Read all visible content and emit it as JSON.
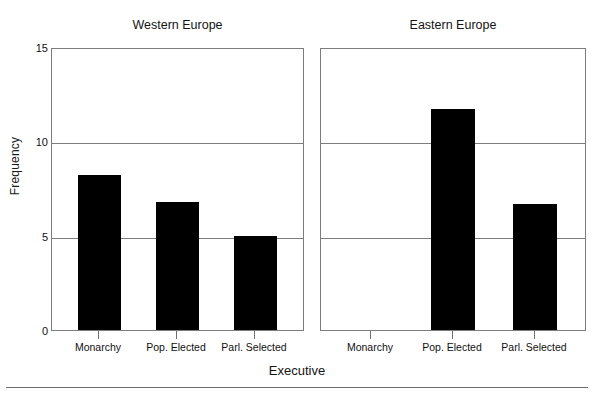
{
  "chart_data": {
    "type": "bar",
    "title": "",
    "xlabel": "Executive",
    "ylabel": "Frequency",
    "categories": [
      "Monarchy",
      "Pop. Elected",
      "Parl. Selected"
    ],
    "ylim": [
      0,
      15
    ],
    "yticks": [
      0,
      5,
      10,
      15
    ],
    "grid": "horizontal gridlines at y = 5 and y = 10",
    "legend": "none",
    "panels": [
      {
        "name": "Western Europe",
        "values": [
          8.2,
          6.8,
          5.0
        ]
      },
      {
        "name": "Eastern Europe",
        "values": [
          0,
          11.7,
          6.7
        ]
      }
    ]
  },
  "axes": {
    "y_title": "Frequency",
    "x_title": "Executive",
    "y_tick_labels": [
      "0",
      "5",
      "10",
      "15"
    ]
  },
  "panel_titles": {
    "left": "Western Europe",
    "right": "Eastern Europe"
  },
  "x_tick_labels": {
    "left": [
      "Monarchy",
      "Pop. Elected",
      "Parl. Selected"
    ],
    "right": [
      "Monarchy",
      "Pop. Elected",
      "Parl. Selected"
    ]
  },
  "colors": {
    "bar": "#000000",
    "axis": "#7d7d7d",
    "grid": "#7d7d7d",
    "text": "#141414",
    "background": "#ffffff"
  }
}
